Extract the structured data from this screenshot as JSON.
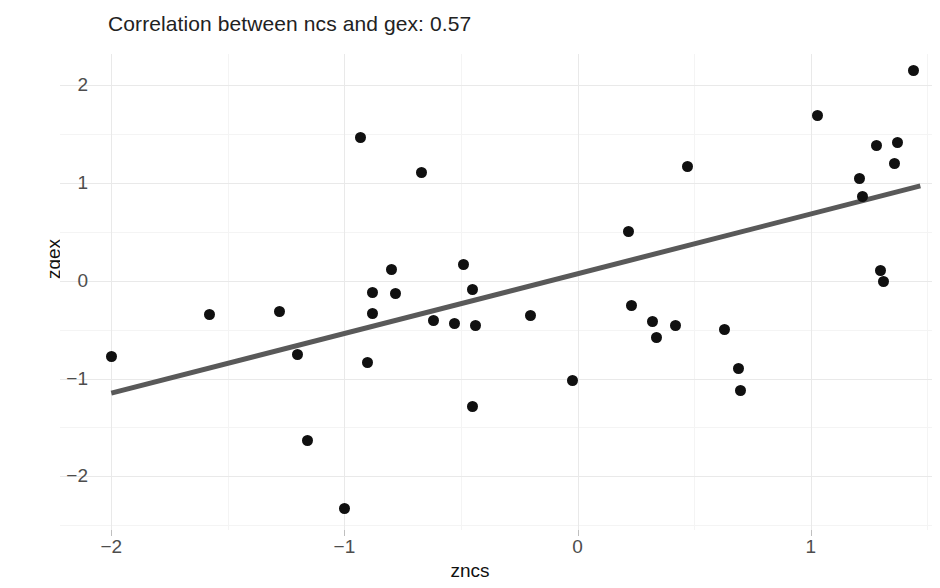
{
  "chart_data": {
    "type": "scatter",
    "title": "Correlation between ncs and gex: 0.57",
    "xlabel": "zncs",
    "ylabel": "zgex",
    "correlation": 0.57,
    "xlim": [
      -2.22,
      1.52
    ],
    "ylim": [
      -2.55,
      2.32
    ],
    "xticks": [
      -2,
      -1,
      0,
      1
    ],
    "xtick_labels": [
      "-2",
      "-1",
      "0",
      "1"
    ],
    "yticks": [
      -2,
      -1,
      0,
      1,
      2
    ],
    "ytick_labels": [
      "-2",
      "-1",
      "0",
      "1",
      "2"
    ],
    "grid": true,
    "legend": "none",
    "point_color": "#101010",
    "line_color": "#595959",
    "background_color": "#ffffff",
    "gridline_color": "#e9e9e9",
    "points": [
      {
        "x": -2.0,
        "y": -0.78
      },
      {
        "x": -1.58,
        "y": -0.35
      },
      {
        "x": -1.28,
        "y": -0.31
      },
      {
        "x": -1.2,
        "y": -0.75
      },
      {
        "x": -1.16,
        "y": -1.63
      },
      {
        "x": -1.0,
        "y": -2.33
      },
      {
        "x": -0.93,
        "y": 1.47
      },
      {
        "x": -0.88,
        "y": -0.12
      },
      {
        "x": -0.88,
        "y": -0.34
      },
      {
        "x": -0.9,
        "y": -0.84
      },
      {
        "x": -0.8,
        "y": 0.12
      },
      {
        "x": -0.78,
        "y": -0.13
      },
      {
        "x": -0.67,
        "y": 1.11
      },
      {
        "x": -0.62,
        "y": -0.41
      },
      {
        "x": -0.53,
        "y": -0.44
      },
      {
        "x": -0.49,
        "y": 0.17
      },
      {
        "x": -0.45,
        "y": -0.09
      },
      {
        "x": -0.44,
        "y": -0.46
      },
      {
        "x": -0.45,
        "y": -1.29
      },
      {
        "x": -0.2,
        "y": -0.36
      },
      {
        "x": -0.02,
        "y": -1.02
      },
      {
        "x": 0.22,
        "y": 0.5
      },
      {
        "x": 0.23,
        "y": -0.25
      },
      {
        "x": 0.32,
        "y": -0.42
      },
      {
        "x": 0.34,
        "y": -0.58
      },
      {
        "x": 0.42,
        "y": -0.46
      },
      {
        "x": 0.47,
        "y": 1.17
      },
      {
        "x": 0.63,
        "y": -0.5
      },
      {
        "x": 0.69,
        "y": -0.9
      },
      {
        "x": 0.7,
        "y": -1.12
      },
      {
        "x": 1.03,
        "y": 1.69
      },
      {
        "x": 1.21,
        "y": 1.05
      },
      {
        "x": 1.22,
        "y": 0.86
      },
      {
        "x": 1.28,
        "y": 1.38
      },
      {
        "x": 1.3,
        "y": 0.11
      },
      {
        "x": 1.31,
        "y": -0.01
      },
      {
        "x": 1.37,
        "y": 1.41
      },
      {
        "x": 1.36,
        "y": 1.2
      },
      {
        "x": 1.44,
        "y": 2.15
      }
    ],
    "trendline": {
      "type": "linear",
      "x_start": -2.0,
      "y_start": -1.15,
      "x_end": 1.47,
      "y_end": 0.97
    }
  }
}
